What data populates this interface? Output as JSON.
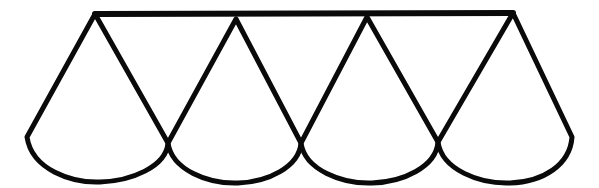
{
  "figure": {
    "description": "Four overlapping teardrop-shaped petals joined by a straight horizontal top bar, each petal formed by two straight sides descending from a pointed apex into a rounded U-shaped bottom arc.",
    "background_color": "#ffffff",
    "ink_color": "#0a0a0a",
    "stroke_width": 5,
    "canvas": {
      "width": 599,
      "height": 188
    },
    "top_bar": {
      "name": "horizontal-top-bar",
      "x1": 95,
      "y1": 14,
      "x2": 513,
      "y2": 13
    },
    "apexes": [
      {
        "label": "apex-1",
        "x": 95,
        "y": 14
      },
      {
        "label": "apex-2",
        "x": 236,
        "y": 19
      },
      {
        "label": "apex-3",
        "x": 367,
        "y": 17
      },
      {
        "label": "apex-4",
        "x": 513,
        "y": 13
      }
    ],
    "crossings": [
      {
        "label": "crossing-1",
        "x": 168,
        "y": 143
      },
      {
        "label": "crossing-2",
        "x": 301,
        "y": 143
      },
      {
        "label": "crossing-3",
        "x": 438,
        "y": 142
      }
    ],
    "outer_points": [
      {
        "label": "outer-left",
        "x": 27,
        "y": 137
      },
      {
        "label": "outer-right",
        "x": 572,
        "y": 137
      }
    ],
    "petals": [
      {
        "label": "petal-1",
        "apex": {
          "x": 95,
          "y": 14
        },
        "left_foot": {
          "x": 27,
          "y": 137
        },
        "right_foot": {
          "x": 168,
          "y": 143
        },
        "arc_bottom_y": 182,
        "path": "M 95 14 L 27 137 C 32 170 72 183 100 182 C 131 181 166 167 168 143 L 95 14"
      },
      {
        "label": "petal-2",
        "apex": {
          "x": 236,
          "y": 19
        },
        "left_foot": {
          "x": 168,
          "y": 143
        },
        "right_foot": {
          "x": 301,
          "y": 143
        },
        "arc_bottom_y": 183,
        "path": "M 236 19 L 168 143 C 172 170 208 184 238 183 C 268 182 299 167 301 143 L 236 19"
      },
      {
        "label": "petal-3",
        "apex": {
          "x": 367,
          "y": 17
        },
        "left_foot": {
          "x": 301,
          "y": 143
        },
        "right_foot": {
          "x": 438,
          "y": 142
        },
        "arc_bottom_y": 183,
        "path": "M 367 17 L 301 143 C 305 170 342 184 372 183 C 403 182 436 167 438 142 L 367 17"
      },
      {
        "label": "petal-4",
        "apex": {
          "x": 513,
          "y": 13
        },
        "left_foot": {
          "x": 438,
          "y": 142
        },
        "right_foot": {
          "x": 572,
          "y": 137
        },
        "arc_bottom_y": 183,
        "path": "M 513 13 L 438 142 C 442 170 480 184 510 183 C 543 182 570 165 572 137 L 513 13"
      }
    ]
  }
}
